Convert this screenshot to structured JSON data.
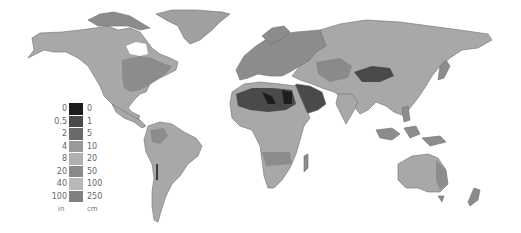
{
  "map": {
    "type": "choropleth",
    "subject": "world precipitation (annual)",
    "projection": "equirectangular-like world map, grayscale"
  },
  "legend": {
    "unit_left": "in",
    "unit_right": "cm",
    "classes": [
      {
        "in": "0",
        "cm": "0",
        "color": "#1e1e1e"
      },
      {
        "in": "0.5",
        "cm": "1",
        "color": "#4a4a4a"
      },
      {
        "in": "2",
        "cm": "5",
        "color": "#6a6a6a"
      },
      {
        "in": "4",
        "cm": "10",
        "color": "#9a9a9a"
      },
      {
        "in": "8",
        "cm": "20",
        "color": "#b0b0b0"
      },
      {
        "in": "20",
        "cm": "50",
        "color": "#8a8a8a"
      },
      {
        "in": "40",
        "cm": "100",
        "color": "#b8b8b8"
      },
      {
        "in": "100",
        "cm": "250",
        "color": "#808080"
      }
    ]
  },
  "colors": {
    "ocean": "#ffffff",
    "land_base": "#a8a8a8",
    "land_wet": "#8c8c8c",
    "desert_dark": "#2a2a2a",
    "desert_mid": "#555555",
    "outline": "#6e6e6e"
  }
}
